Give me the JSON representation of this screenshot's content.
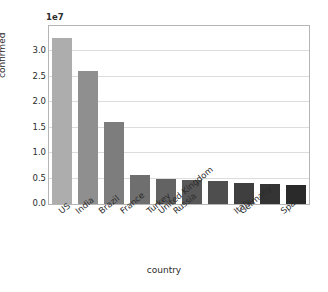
{
  "chart_data": {
    "type": "bar",
    "title": "",
    "xlabel": "country",
    "ylabel": "confirmed",
    "offset_text": "1e7",
    "categories": [
      "US",
      "India",
      "Brazil",
      "France",
      "Turkey",
      "Russia",
      "United Kingdom",
      "Italy",
      "Germany",
      "Spain"
    ],
    "values": [
      32700000,
      26200000,
      16100000,
      5800000,
      5000000,
      4800000,
      4500000,
      4200000,
      3900000,
      3800000
    ],
    "values_scaled": [
      3.27,
      2.62,
      1.61,
      0.58,
      0.5,
      0.48,
      0.45,
      0.42,
      0.39,
      0.38
    ],
    "bar_colors": [
      "#adadad",
      "#8f8f8f",
      "#7d7d7d",
      "#6f6f6f",
      "#636363",
      "#585858",
      "#4e4e4e",
      "#3f3f3f",
      "#343434",
      "#2a2a2a"
    ],
    "ylim": [
      0,
      3.5
    ],
    "ytick_labels": [
      "0.0",
      "0.5",
      "1.0",
      "1.5",
      "2.0",
      "2.5",
      "3.0"
    ],
    "ytick_values": [
      0.0,
      0.5,
      1.0,
      1.5,
      2.0,
      2.5,
      3.0
    ],
    "grid": true,
    "grid_axis": "y",
    "legend": "none",
    "background_color": "#ffffff",
    "axes_edge_color": "#b5b5b5",
    "grid_color": "#dcdcdc"
  }
}
